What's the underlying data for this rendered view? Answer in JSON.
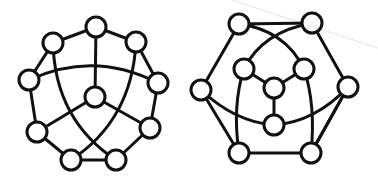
{
  "diagram": {
    "type": "graph-drawings",
    "colors": {
      "stroke": "#111111",
      "node_fill": "#ffffff",
      "background": "#ffffff",
      "artifact": "#e4e4e4"
    },
    "node_radius": 10,
    "graphs": [
      {
        "id": "left-graph",
        "nodes": [
          {
            "id": "top",
            "x": 96,
            "y": 27
          },
          {
            "id": "upper-left",
            "x": 53,
            "y": 43
          },
          {
            "id": "upper-right",
            "x": 136,
            "y": 42
          },
          {
            "id": "left",
            "x": 29,
            "y": 80
          },
          {
            "id": "right",
            "x": 158,
            "y": 83
          },
          {
            "id": "center",
            "x": 95,
            "y": 97
          },
          {
            "id": "lower-left",
            "x": 37,
            "y": 132
          },
          {
            "id": "lower-right",
            "x": 150,
            "y": 128
          },
          {
            "id": "bottom-left",
            "x": 71,
            "y": 160
          },
          {
            "id": "bottom-right",
            "x": 116,
            "y": 160
          }
        ],
        "edges": [
          {
            "from": "top",
            "to": "upper-left",
            "path": "M96 27 L53 43"
          },
          {
            "from": "top",
            "to": "upper-right",
            "path": "M96 27 L136 42"
          },
          {
            "from": "upper-left",
            "to": "left",
            "path": "M53 43 L29 80"
          },
          {
            "from": "upper-right",
            "to": "right",
            "path": "M136 42 L158 83"
          },
          {
            "from": "left",
            "to": "lower-left",
            "path": "M29 80 L37 132"
          },
          {
            "from": "right",
            "to": "lower-right",
            "path": "M158 83 L150 128"
          },
          {
            "from": "lower-left",
            "to": "bottom-left",
            "path": "M37 132 L71 160"
          },
          {
            "from": "lower-right",
            "to": "bottom-right",
            "path": "M150 128 L116 160"
          },
          {
            "from": "bottom-left",
            "to": "bottom-right",
            "path": "M71 160 L116 160"
          },
          {
            "from": "top",
            "to": "center",
            "path": "M96 27 L95 97"
          },
          {
            "from": "center",
            "to": "lower-left",
            "path": "M95 97 L37 132"
          },
          {
            "from": "center",
            "to": "lower-right",
            "path": "M95 97 L150 128"
          },
          {
            "from": "left",
            "to": "right",
            "path": "M29 80 Q94 50 158 83"
          },
          {
            "from": "upper-left",
            "to": "bottom-right",
            "path": "M53 43 Q55 120 116 160"
          },
          {
            "from": "upper-right",
            "to": "bottom-left",
            "path": "M136 42 Q132 120 71 160"
          }
        ]
      },
      {
        "id": "right-graph",
        "nodes": [
          {
            "id": "top-left",
            "x": 239,
            "y": 24
          },
          {
            "id": "top-right",
            "x": 312,
            "y": 23
          },
          {
            "id": "inner-left",
            "x": 244,
            "y": 69
          },
          {
            "id": "inner-right",
            "x": 304,
            "y": 69
          },
          {
            "id": "center",
            "x": 274,
            "y": 88
          },
          {
            "id": "left",
            "x": 201,
            "y": 90
          },
          {
            "id": "right",
            "x": 348,
            "y": 87
          },
          {
            "id": "inner-bottom",
            "x": 274,
            "y": 125
          },
          {
            "id": "bottom-left",
            "x": 239,
            "y": 153
          },
          {
            "id": "bottom-right",
            "x": 311,
            "y": 153
          }
        ],
        "edges": [
          {
            "from": "top-left",
            "to": "top-right",
            "path": "M239 24 L312 23"
          },
          {
            "from": "top-left",
            "to": "left",
            "path": "M239 24 L201 90"
          },
          {
            "from": "top-right",
            "to": "right",
            "path": "M312 23 L348 87"
          },
          {
            "from": "left",
            "to": "bottom-left",
            "path": "M201 90 L239 153"
          },
          {
            "from": "right",
            "to": "bottom-right",
            "path": "M348 87 L311 153"
          },
          {
            "from": "bottom-left",
            "to": "bottom-right",
            "path": "M239 153 L311 153"
          },
          {
            "from": "top-left",
            "to": "inner-right",
            "path": "M239 24 Q285 30 304 69"
          },
          {
            "from": "top-right",
            "to": "inner-left",
            "path": "M312 23 Q262 32 244 69"
          },
          {
            "from": "inner-left",
            "to": "center",
            "path": "M244 69 L274 88"
          },
          {
            "from": "inner-right",
            "to": "center",
            "path": "M304 69 L274 88"
          },
          {
            "from": "center",
            "to": "inner-bottom",
            "path": "M274 88 L274 125"
          },
          {
            "from": "left",
            "to": "inner-bottom",
            "path": "M201 90 Q235 122 274 125"
          },
          {
            "from": "inner-bottom",
            "to": "right",
            "path": "M274 125 Q315 122 348 87"
          },
          {
            "from": "inner-left",
            "to": "bottom-left",
            "path": "M244 69 Q232 105 239 153"
          },
          {
            "from": "inner-right",
            "to": "bottom-right",
            "path": "M304 69 Q316 105 311 153"
          },
          {
            "from": "right",
            "to": "bottom-left-diag",
            "path": "M348 87 L311 153"
          }
        ]
      }
    ],
    "artifact_line": {
      "path": "M232 0 L378 48"
    }
  }
}
